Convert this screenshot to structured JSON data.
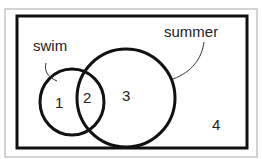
{
  "diagram": {
    "type": "venn",
    "sets": [
      {
        "id": "swim",
        "label": "swim"
      },
      {
        "id": "summer",
        "label": "summer"
      }
    ],
    "regions": [
      {
        "id": "region-1",
        "label": "1",
        "description": "swim only"
      },
      {
        "id": "region-2",
        "label": "2",
        "description": "swim and summer"
      },
      {
        "id": "region-3",
        "label": "3",
        "description": "summer only"
      },
      {
        "id": "region-4",
        "label": "4",
        "description": "neither"
      }
    ],
    "colors": {
      "stroke": "#111111",
      "outer_border": "#b8b8b8",
      "background": "#ffffff",
      "text": "#222222"
    }
  }
}
